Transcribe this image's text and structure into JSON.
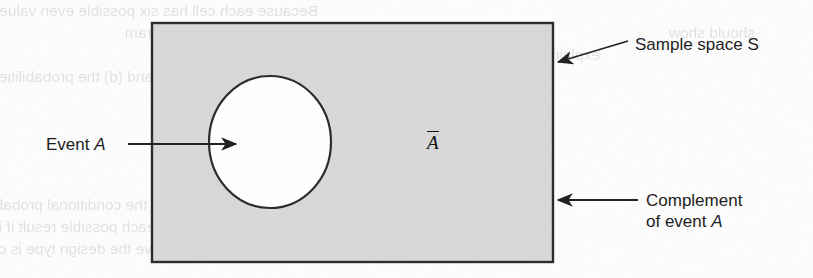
{
  "figure": {
    "type": "venn-complement-diagram",
    "caption_labels": {
      "event_a": {
        "prefix": "Event ",
        "symbol": "A"
      },
      "complement_symbol": "A",
      "sample_space": "Sample space S",
      "complement": {
        "line1": "Complement",
        "line2_prefix": "of event ",
        "line2_symbol": "A"
      }
    },
    "colors": {
      "sample_space_fill": "#d8d8d8",
      "event_fill": "#ffffff",
      "outline": "#2b2b2b",
      "page_background": "#fdfdfd",
      "text": "#1a1a1a"
    },
    "geometry": {
      "rect": {
        "x": 152,
        "y": 23,
        "width": 401,
        "height": 239
      },
      "ellipse": {
        "cx": 270,
        "cy": 142,
        "rx": 61,
        "ry": 66
      }
    },
    "arrows": [
      {
        "name": "event-a-arrow",
        "from_x": 128,
        "from_y": 144,
        "to_x": 236,
        "to_y": 144
      },
      {
        "name": "sample-space-arrow",
        "from_x": 628,
        "from_y": 41,
        "to_x": 556,
        "to_y": 63
      },
      {
        "name": "complement-arrow",
        "from_x": 638,
        "from_y": 200,
        "to_x": 556,
        "to_y": 200
      }
    ]
  },
  "page_bleed_through": [
    {
      "text": "Because each cell has six possible even values (2, 4, 6, 8, 10",
      "x": 18,
      "y": 2
    },
    {
      "text": "odd values, the Venn diagram",
      "x": 30,
      "y": 24
    },
    {
      "text": "should show",
      "x": 455,
      "y": 24
    },
    {
      "text": "explain.",
      "x": 300,
      "y": 46
    },
    {
      "text": "What are the values for (c) and (d) the probabilities requested",
      "x": 40,
      "y": 68
    },
    {
      "text": "in part a.",
      "x": 55,
      "y": 112
    },
    {
      "text": "In the same way, assess the conditional probabilities in",
      "x": 20,
      "y": 196
    },
    {
      "text": "the best of three clients each possible result if it loses to the",
      "x": 20,
      "y": 218
    },
    {
      "text": "sample points in the above the design type is over budget.",
      "x": 20,
      "y": 240
    }
  ]
}
